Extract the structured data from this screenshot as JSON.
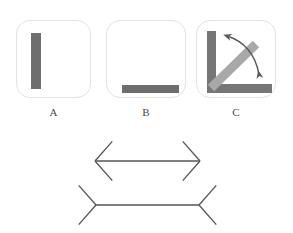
{
  "figure": {
    "background_color": "#ffffff",
    "panel_border_color": "#e3e3e3",
    "bar_color": "#6e6e6e",
    "bar_color_dark": "#767676",
    "diagonal_color": "#a8a8a8",
    "line_color": "#555555",
    "label_color": "#4a4a4a"
  },
  "panels": [
    {
      "id": "A",
      "label": "A",
      "description": "vertical bar",
      "orientation": "vertical",
      "frame": {
        "x": 16,
        "y": 20,
        "width": 75,
        "height": 78
      },
      "bar": {
        "x": 30,
        "y": 32,
        "width": 10,
        "height": 56
      }
    },
    {
      "id": "B",
      "label": "B",
      "description": "horizontal bar",
      "orientation": "horizontal",
      "frame": {
        "x": 106,
        "y": 20,
        "width": 80,
        "height": 78
      },
      "bar": {
        "x": 121,
        "y": 84,
        "width": 57,
        "height": 8
      }
    },
    {
      "id": "C",
      "label": "C",
      "description": "L-shape with rotating diagonal arm and curved double arrow",
      "orientation": "rotating",
      "frame": {
        "x": 196,
        "y": 20,
        "width": 80,
        "height": 78
      },
      "vertical_arm": {
        "x": 206,
        "y": 30,
        "width": 9,
        "height": 62
      },
      "horizontal_arm": {
        "x": 206,
        "y": 83,
        "width": 65,
        "height": 9
      },
      "diagonal_arm": {
        "from_x": 211,
        "from_y": 88,
        "to_x": 256,
        "to_y": 44,
        "width": 9
      },
      "arc": {
        "start_x": 227,
        "start_y": 36,
        "end_x": 259,
        "end_y": 74
      },
      "arrowheads": [
        "up-left",
        "down-right"
      ]
    }
  ],
  "illusion": {
    "name": "Muller-Lyer",
    "figures": [
      {
        "id": "outward",
        "description": "line with outward pointing arrowheads",
        "shaft": {
          "x1": 96,
          "y1": 161,
          "x2": 199,
          "y2": 161
        },
        "fins": "outward",
        "left_apex_x": 95,
        "right_apex_x": 200,
        "fin_length": 24
      },
      {
        "id": "inward",
        "description": "line with inward pointing arrowheads",
        "shaft": {
          "x1": 96,
          "y1": 205,
          "x2": 199,
          "y2": 205
        },
        "fins": "inward",
        "left_apex_x": 96,
        "right_apex_x": 199,
        "fin_length": 24
      }
    ]
  }
}
